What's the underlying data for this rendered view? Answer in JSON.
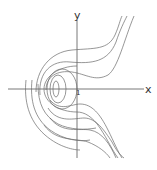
{
  "diagram": {
    "type": "phase-portrait",
    "axes": {
      "x_label": "x",
      "y_label": "y",
      "tick_label": "1"
    },
    "colors": {
      "axis": "#555555",
      "curve": "#6a6a6a",
      "background": "#ffffff"
    }
  }
}
